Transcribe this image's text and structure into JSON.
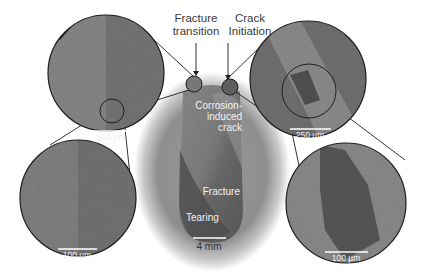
{
  "figure": {
    "annotations": {
      "fracture_transition": "Fracture\ntransition",
      "fracture_transition_line1": "Fracture",
      "fracture_transition_line2": "transition",
      "crack_initiation_line1": "Crack",
      "crack_initiation_line2": "Initiation",
      "corrosion_line1": "Corrosion-",
      "corrosion_line2": "induced",
      "corrosion_line3": "crack",
      "fracture": "Fracture",
      "tearing": "Tearing"
    },
    "scale_bars": {
      "specimen": "4 mm",
      "top_left": "500 µm",
      "bottom_left": "100 µm",
      "top_right": "250 µm",
      "bottom_right": "100 µm"
    },
    "colors": {
      "background": "#ffffff",
      "circle_outline": "#1e1e1e",
      "micrograph_gray": "#7a7a7a",
      "label_text": "#3a3a3a",
      "overlay_text": "#f2f2f2"
    }
  }
}
